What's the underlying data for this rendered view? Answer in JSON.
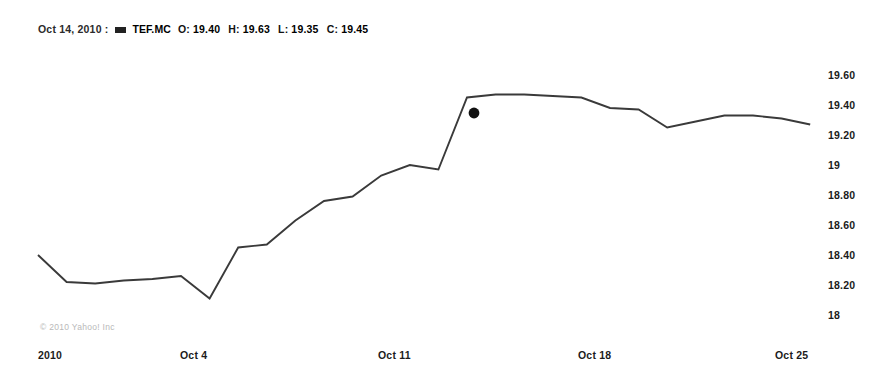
{
  "header": {
    "date": "Oct 14, 2010",
    "separator": ":",
    "legend_swatch_name": "series-color-swatch",
    "ticker": "TEF.MC",
    "fields": [
      {
        "label": "O:",
        "value": "19.40"
      },
      {
        "label": "H:",
        "value": "19.63"
      },
      {
        "label": "L:",
        "value": "19.35"
      },
      {
        "label": "C:",
        "value": "19.45"
      }
    ]
  },
  "watermark": "© 2010 Yahoo! Inc",
  "colors": {
    "line": "#3a3a3a",
    "marker": "#111111",
    "text": "#1b1b1b",
    "background": "#ffffff",
    "watermark": "#b9b9b9"
  },
  "chart_data": {
    "type": "line",
    "title": "",
    "subtitle": "",
    "xlabel": "",
    "ylabel": "",
    "grid": false,
    "legend_position": "top-left",
    "series": [
      {
        "name": "TEF.MC",
        "x": [
          "2010-10-01",
          "2010-10-02",
          "2010-10-03",
          "2010-10-04",
          "2010-10-05",
          "2010-10-06",
          "2010-10-07",
          "2010-10-08",
          "2010-10-09",
          "2010-10-10",
          "2010-10-11",
          "2010-10-12",
          "2010-10-13",
          "2010-10-14",
          "2010-10-15",
          "2010-10-16",
          "2010-10-17",
          "2010-10-18",
          "2010-10-19",
          "2010-10-20",
          "2010-10-21",
          "2010-10-22",
          "2010-10-23",
          "2010-10-24",
          "2010-10-25",
          "2010-10-26",
          "2010-10-27",
          "2010-10-28"
        ],
        "values": [
          18.4,
          18.22,
          18.21,
          18.23,
          18.24,
          18.26,
          18.11,
          18.45,
          18.47,
          18.63,
          18.76,
          18.79,
          18.93,
          19.0,
          18.97,
          19.45,
          19.47,
          19.47,
          19.46,
          19.45,
          19.38,
          19.37,
          19.25,
          19.29,
          19.33,
          19.33,
          19.31,
          19.27
        ]
      }
    ],
    "marker": {
      "label": "Oct 14, 2010",
      "value": 19.45,
      "x_pixel": 474,
      "y_pixel": 113
    },
    "ylim": [
      17.92,
      19.72
    ],
    "yticks": [
      "19.60",
      "19.40",
      "19.20",
      "19",
      "18.80",
      "18.60",
      "18.40",
      "18.20",
      "18"
    ],
    "ytick_values": [
      19.6,
      19.4,
      19.2,
      19.0,
      18.8,
      18.6,
      18.4,
      18.2,
      18.0
    ],
    "xticks": [
      "2010",
      "Oct 4",
      "Oct 11",
      "Oct 18",
      "Oct 25"
    ],
    "xtick_pixels": [
      38,
      180,
      378,
      578,
      775
    ]
  },
  "geometry": {
    "y_value_top": 19.6,
    "y_pixel_top": 75,
    "pixels_per_unit": 150,
    "x_start_pixel": 38,
    "x_step_pixel": 28.6
  }
}
